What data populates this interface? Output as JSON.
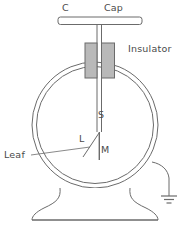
{
  "figure": {
    "labels": {
      "c": "C",
      "cap": "Cap",
      "insulator": "Insulator",
      "s": "S",
      "l": "L",
      "m": "M",
      "leaf": "Leaf"
    },
    "colors": {
      "stroke": "#6b6b6b",
      "text": "#4a4a4a",
      "insulator_fill": "#b9b9b9",
      "background": "#ffffff"
    },
    "parts": [
      {
        "name": "cap-plate",
        "label": "Cap"
      },
      {
        "name": "cap-terminal",
        "label": "C"
      },
      {
        "name": "insulator-block",
        "label": "Insulator"
      },
      {
        "name": "stem",
        "label": "S"
      },
      {
        "name": "leaf",
        "label": "L"
      },
      {
        "name": "metal-plate",
        "label": "M"
      },
      {
        "name": "leaf-callout",
        "label": "Leaf"
      },
      {
        "name": "glass-jar",
        "label": ""
      },
      {
        "name": "base-stand",
        "label": ""
      },
      {
        "name": "earth-ground",
        "label": ""
      }
    ]
  }
}
